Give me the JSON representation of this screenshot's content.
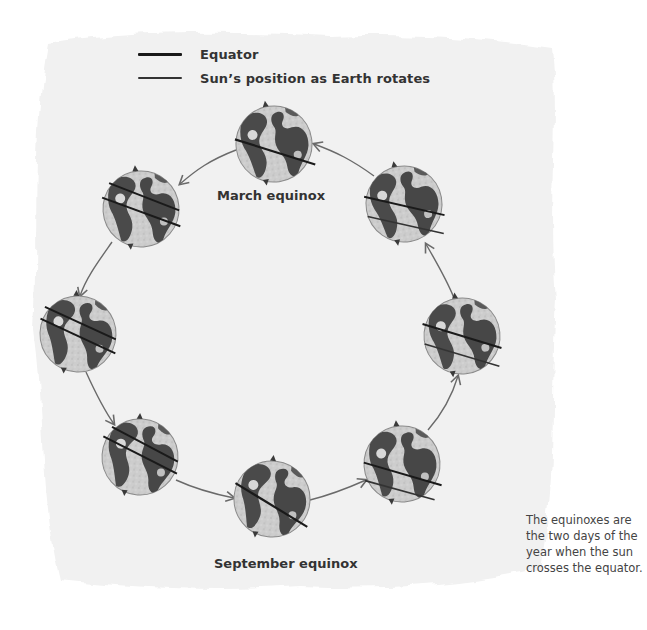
{
  "legend": {
    "items": [
      {
        "label": "Equator",
        "color": "#1a1a1a"
      },
      {
        "label": "Sun’s position as Earth rotates",
        "color": "#1a1a1a"
      }
    ]
  },
  "labels": {
    "march": "March equinox",
    "september": "September equinox"
  },
  "caption": "The equinoxes are the two days of the year when the sun crosses the equator.",
  "colors": {
    "paper": "#f1f1f1",
    "globe_ocean": "#c9c9c9",
    "globe_land": "#4a4a4a",
    "line": "#1a1a1a",
    "arrow": "#6a6a6a"
  },
  "globes": [
    {
      "name": "march-equinox",
      "cx": 274,
      "cy": 144,
      "r": 38,
      "lines": 1
    },
    {
      "name": "upper-right",
      "cx": 404,
      "cy": 204,
      "r": 38,
      "lines": 2
    },
    {
      "name": "right",
      "cx": 462,
      "cy": 336,
      "r": 38,
      "lines": 2
    },
    {
      "name": "lower-right",
      "cx": 402,
      "cy": 464,
      "r": 38,
      "lines": 2
    },
    {
      "name": "september-equinox",
      "cx": 272,
      "cy": 499,
      "r": 38,
      "lines": 1
    },
    {
      "name": "lower-left",
      "cx": 140,
      "cy": 457,
      "r": 38,
      "lines": 2
    },
    {
      "name": "left",
      "cx": 78,
      "cy": 334,
      "r": 38,
      "lines": 2
    },
    {
      "name": "upper-left",
      "cx": 141,
      "cy": 209,
      "r": 38,
      "lines": 2
    }
  ]
}
